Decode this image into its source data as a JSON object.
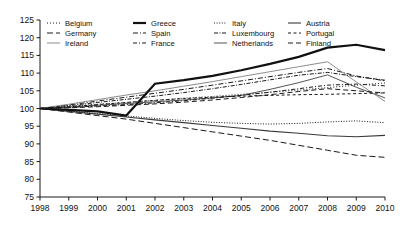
{
  "chart_data": {
    "type": "line",
    "title": "",
    "subtitle": "",
    "xlabel": "",
    "ylabel": "",
    "xlim": [
      1998,
      2010
    ],
    "ylim": [
      75,
      125
    ],
    "ytick_step": 5,
    "grid": false,
    "legend_position": "top",
    "legend_columns": 4,
    "x": [
      1998,
      1999,
      2000,
      2001,
      2002,
      2003,
      2004,
      2005,
      2006,
      2007,
      2008,
      2009,
      2010
    ],
    "xticklabels": [
      "1998",
      "1999",
      "2000",
      "2001",
      "2002",
      "2003",
      "2004",
      "2005",
      "2006",
      "2007",
      "2008",
      "2009",
      "2010"
    ],
    "yticklabels": [
      "75",
      "80",
      "85",
      "90",
      "95",
      "100",
      "105",
      "110",
      "115",
      "120",
      "125"
    ],
    "yticks": [
      75,
      80,
      85,
      90,
      95,
      100,
      105,
      110,
      115,
      120,
      125
    ],
    "series": [
      {
        "name": "Belgium",
        "style": "dotted",
        "color": "#1a1a1a",
        "width": 1.0,
        "dash": "1,2",
        "values": [
          100,
          100.6,
          101.2,
          101.7,
          102.3,
          102.9,
          103.4,
          104.0,
          104.6,
          105.2,
          105.9,
          106.6,
          107.2
        ]
      },
      {
        "name": "Spain",
        "style": "dash-dot",
        "color": "#1a1a1a",
        "width": 1.0,
        "dash": "5,2,1,2",
        "values": [
          100,
          101.0,
          102.1,
          103.2,
          104.3,
          105.4,
          106.6,
          107.8,
          109.0,
          110.2,
          111.3,
          109.2,
          107.8
        ]
      },
      {
        "name": "Netherlands",
        "style": "solid-thin",
        "color": "#555555",
        "width": 1.0,
        "dash": "none",
        "values": [
          100,
          100.4,
          100.9,
          101.4,
          101.9,
          102.4,
          103.0,
          103.7,
          105.4,
          107.3,
          109.5,
          106.0,
          103.0
        ]
      },
      {
        "name": "Germany",
        "style": "long-dash",
        "color": "#1a1a1a",
        "width": 1.0,
        "dash": "6,3",
        "values": [
          100,
          99.0,
          98.0,
          97.0,
          95.8,
          94.6,
          93.4,
          92.2,
          91.0,
          89.6,
          88.2,
          86.8,
          86.2
        ]
      },
      {
        "name": "France",
        "style": "dash-dot-dot",
        "color": "#1a1a1a",
        "width": 1.0,
        "dash": "4,2,1,2",
        "values": [
          100,
          100.3,
          100.7,
          101.1,
          101.6,
          102.2,
          102.9,
          103.7,
          104.6,
          105.6,
          106.6,
          106.9,
          106.4
        ]
      },
      {
        "name": "Austria",
        "style": "solid-medium",
        "color": "#3a3a3a",
        "width": 1.1,
        "dash": "none",
        "values": [
          100,
          99.2,
          98.4,
          97.6,
          96.8,
          96.0,
          95.2,
          94.4,
          93.6,
          93.0,
          92.3,
          92.0,
          92.4
        ]
      },
      {
        "name": "Ireland",
        "style": "solid-light",
        "color": "#8c8c8c",
        "width": 1.0,
        "dash": "none",
        "values": [
          100,
          101.2,
          102.5,
          103.8,
          105.0,
          106.3,
          107.6,
          109.0,
          110.4,
          111.8,
          113.2,
          107.5,
          102.0
        ]
      },
      {
        "name": "Italy",
        "style": "fine-dot",
        "color": "#1a1a1a",
        "width": 1.0,
        "dash": "1,1.6",
        "values": [
          100,
          99.3,
          98.6,
          97.9,
          97.2,
          96.6,
          96.1,
          95.8,
          95.6,
          95.8,
          96.2,
          96.5,
          96.0
        ]
      },
      {
        "name": "Portugal",
        "style": "dash-short-gap",
        "color": "#1a1a1a",
        "width": 1.0,
        "dash": "3,2.5",
        "values": [
          100,
          100.5,
          101.1,
          101.7,
          102.3,
          102.8,
          103.2,
          103.5,
          103.7,
          103.9,
          104.0,
          104.2,
          104.4
        ]
      },
      {
        "name": "Greece",
        "style": "solid-thick",
        "color": "#111111",
        "width": 2.2,
        "dash": "none",
        "values": [
          100,
          99.6,
          99.2,
          98.0,
          107.0,
          108.0,
          109.2,
          110.8,
          112.6,
          114.6,
          117.2,
          118.0,
          116.5
        ]
      },
      {
        "name": "Luxembourg",
        "style": "dash-dot-fine",
        "color": "#1a1a1a",
        "width": 1.0,
        "dash": "4,1.5,1,1.5",
        "values": [
          100,
          100.8,
          101.7,
          102.6,
          103.5,
          104.5,
          105.6,
          106.8,
          108.1,
          109.4,
          110.2,
          109.0,
          108.0
        ]
      },
      {
        "name": "Finland",
        "style": "med-dash",
        "color": "#1a1a1a",
        "width": 1.0,
        "dash": "5,3",
        "values": [
          100,
          100.2,
          100.5,
          100.9,
          101.3,
          101.8,
          102.4,
          103.1,
          103.9,
          104.8,
          105.6,
          105.0,
          104.4
        ]
      }
    ]
  },
  "legend": {
    "items": [
      {
        "label": "Belgium",
        "dash": "1,2",
        "width": 1.0,
        "color": "#1a1a1a"
      },
      {
        "label": "Germany",
        "dash": "6,3",
        "width": 1.0,
        "color": "#1a1a1a"
      },
      {
        "label": "Ireland",
        "dash": "none",
        "width": 1.0,
        "color": "#8c8c8c"
      },
      {
        "label": "Greece",
        "dash": "none",
        "width": 2.2,
        "color": "#111111"
      },
      {
        "label": "Spain",
        "dash": "5,2,1,2",
        "width": 1.0,
        "color": "#1a1a1a"
      },
      {
        "label": "France",
        "dash": "4,2,1,2",
        "width": 1.0,
        "color": "#1a1a1a"
      },
      {
        "label": "Italy",
        "dash": "1,1.6",
        "width": 1.0,
        "color": "#1a1a1a"
      },
      {
        "label": "Luxembourg",
        "dash": "4,1.5,1,1.5",
        "width": 1.0,
        "color": "#1a1a1a"
      },
      {
        "label": "Netherlands",
        "dash": "none",
        "width": 1.0,
        "color": "#555555"
      },
      {
        "label": "Austria",
        "dash": "none",
        "width": 1.1,
        "color": "#3a3a3a"
      },
      {
        "label": "Portugal",
        "dash": "3,2.5",
        "width": 1.0,
        "color": "#1a1a1a"
      },
      {
        "label": "Finland",
        "dash": "5,3",
        "width": 1.0,
        "color": "#1a1a1a"
      }
    ]
  }
}
